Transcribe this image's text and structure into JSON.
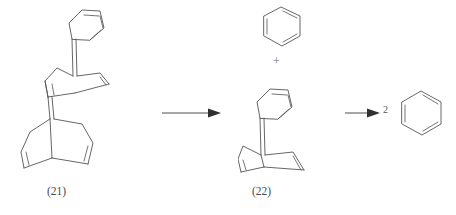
{
  "diagram": {
    "type": "chemical-reaction-scheme",
    "background_color": "#ffffff",
    "line_color": "#555555",
    "structures": [
      {
        "id": "structure-21",
        "label": "(21)",
        "name": "bis-benzo-fused bicyclo[2.2.2]octadiene dimer",
        "components": [
          "benzene ring",
          "upper bicyclooctadiene cage",
          "lower bicyclooctadiene cage"
        ]
      },
      {
        "id": "structure-benzene-top",
        "label": "",
        "name": "benzene"
      },
      {
        "id": "structure-22",
        "label": "(22)",
        "name": "benzo-fused bicyclo[2.2.2]octadiene",
        "components": [
          "benzene ring",
          "bicyclooctadiene cage"
        ]
      },
      {
        "id": "structure-benzene-product",
        "label": "",
        "name": "benzene",
        "coefficient": "2"
      }
    ],
    "operators": {
      "plus": "+",
      "coefficient": "2"
    },
    "arrows": [
      {
        "id": "arrow-1",
        "direction": "right",
        "label": ""
      },
      {
        "id": "arrow-2",
        "direction": "right",
        "label": ""
      }
    ]
  }
}
